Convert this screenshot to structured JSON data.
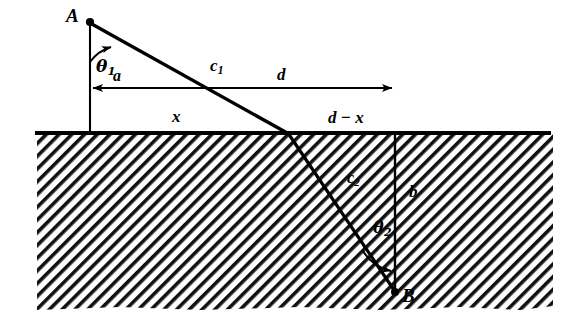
{
  "figure": {
    "type": "geometric-diagram",
    "canvas": {
      "width": 574,
      "height": 332,
      "background": "#ffffff"
    },
    "ink_color": "#000000",
    "points": {
      "A": {
        "label": "A",
        "x": 90,
        "y": 22,
        "description": "source point above the interface"
      },
      "B": {
        "label": "B",
        "x": 395,
        "y": 292,
        "description": "receiver point below the interface"
      },
      "refraction": {
        "x": 288,
        "y": 133,
        "description": "ray crossing point on the interface"
      }
    },
    "segments": {
      "c1": {
        "label": "c",
        "sub": "1",
        "from": "A",
        "to": "refraction",
        "description": "upper-medium ray path"
      },
      "c2": {
        "label": "c",
        "sub": "2",
        "from": "refraction",
        "to": "B",
        "description": "lower-medium ray path"
      },
      "a": {
        "label": "a",
        "description": "vertical offset of A above the interface",
        "arrow": "left"
      },
      "b": {
        "label": "b",
        "description": "vertical depth of B below the interface",
        "arrow": "none"
      },
      "d": {
        "label": "d",
        "description": "total horizontal separation",
        "arrow": "right"
      },
      "x": {
        "label": "x",
        "description": "horizontal distance from A to the crossing point"
      },
      "dx": {
        "label": "d − x",
        "description": "horizontal distance from the crossing point to B"
      }
    },
    "angles": {
      "theta1": {
        "label": "θ",
        "sub": "1",
        "description": "angle of incidence measured from the vertical at A"
      },
      "theta2": {
        "label": "θ",
        "sub": "2",
        "description": "angle of refraction measured from the vertical at B"
      }
    },
    "regions": {
      "upper": {
        "description": "unhatched medium above the interface",
        "fill": "#ffffff"
      },
      "lower": {
        "description": "hatched medium below the interface",
        "hatch_angle_deg": 45,
        "hatch_color": "#000000"
      }
    },
    "interface": {
      "description": "thick horizontal ground / interface line",
      "y": 133,
      "x_start": 35,
      "x_end": 551
    }
  }
}
